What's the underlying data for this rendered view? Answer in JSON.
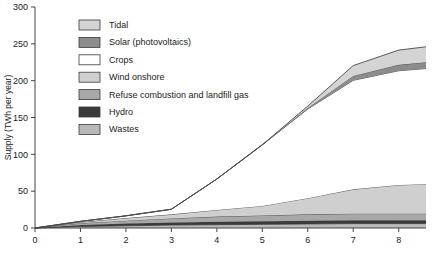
{
  "chart_data": {
    "type": "area",
    "title": "",
    "xlabel": "",
    "ylabel": "Supply (TWh per year)",
    "xlim": [
      0,
      8.6
    ],
    "ylim": [
      0,
      300
    ],
    "ytick_values": [
      0,
      50,
      100,
      150,
      200,
      250,
      300
    ],
    "ytick_labels": [
      "0",
      "50",
      "100",
      "150",
      "200",
      "250",
      "300"
    ],
    "xtick_values": [
      0,
      1,
      2,
      3,
      4,
      5,
      6,
      7,
      8
    ],
    "xtick_labels": [
      "0",
      "1",
      "2",
      "3",
      "4",
      "5",
      "6",
      "7",
      "8"
    ],
    "grid": false,
    "stacked": true,
    "legend_position": "upper-left-inside",
    "x": [
      0,
      1,
      2,
      3,
      4,
      5,
      6,
      7,
      8,
      8.6
    ],
    "series": [
      {
        "name": "Wastes",
        "color": "#b9b9b9",
        "values": [
          0,
          2,
          3,
          4,
          4.5,
          5,
          5.5,
          6,
          6,
          6
        ]
      },
      {
        "name": "Hydro",
        "color": "#3a3a3a",
        "values": [
          0,
          2,
          3,
          3.5,
          4,
          4,
          4.5,
          4.5,
          4.5,
          4.5
        ]
      },
      {
        "name": "Refuse combustion and landfill gas",
        "color": "#a8a8a8",
        "values": [
          0,
          2.5,
          4,
          5.5,
          7,
          8,
          8.5,
          9,
          9,
          9
        ]
      },
      {
        "name": "Wind onshore",
        "color": "#cfcfcf",
        "values": [
          0,
          1.5,
          3.5,
          5.5,
          9,
          13,
          22,
          33,
          39,
          40
        ]
      },
      {
        "name": "Crops",
        "color": "#ffffff",
        "values": [
          0,
          1,
          3,
          7,
          42,
          83,
          121,
          148,
          155,
          157
        ]
      },
      {
        "name": "Solar (photovoltaics)",
        "color": "#8c8c8c",
        "values": [
          0,
          0,
          0,
          0,
          0,
          0,
          1.5,
          6,
          8,
          8.5
        ]
      },
      {
        "name": "Tidal",
        "color": "#d4d4d4",
        "values": [
          0,
          0,
          0,
          0,
          0,
          0,
          2.5,
          14,
          20,
          21
        ]
      }
    ],
    "legend_entries": [
      {
        "label": "Tidal",
        "color": "#d4d4d4"
      },
      {
        "label": "Solar (photovoltaics)",
        "color": "#8c8c8c"
      },
      {
        "label": "Crops",
        "color": "#ffffff"
      },
      {
        "label": "Wind onshore",
        "color": "#cfcfcf"
      },
      {
        "label": "Refuse combustion and landfill gas",
        "color": "#a8a8a8"
      },
      {
        "label": "Hydro",
        "color": "#3a3a3a"
      },
      {
        "label": "Wastes",
        "color": "#b9b9b9"
      }
    ]
  }
}
